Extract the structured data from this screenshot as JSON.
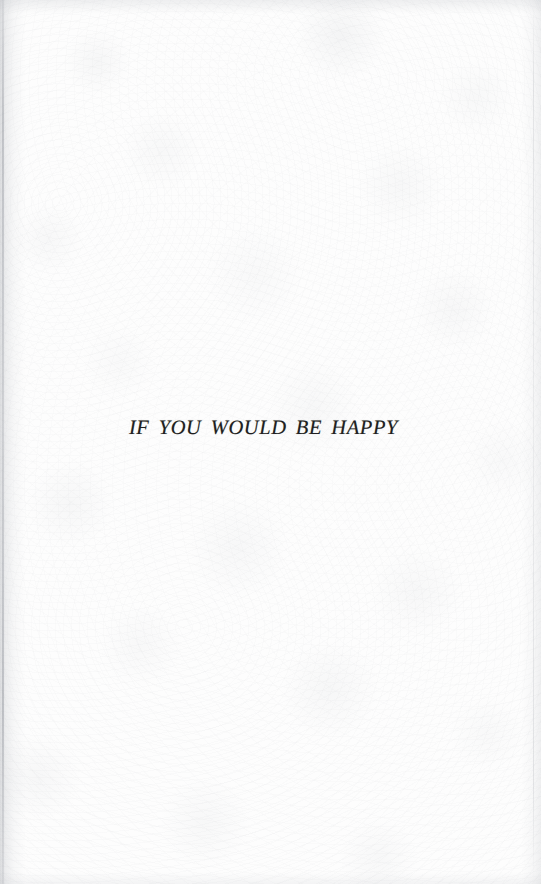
{
  "page": {
    "kind": "scanned-book-section-title-page",
    "width": 541,
    "height": 884,
    "paper_color": "#fdfdfd",
    "ink_color": "#1f1f21",
    "edge_shadow_color": "#8c9098"
  },
  "content": {
    "section_title": "IF YOU WOULD BE HAPPY"
  }
}
